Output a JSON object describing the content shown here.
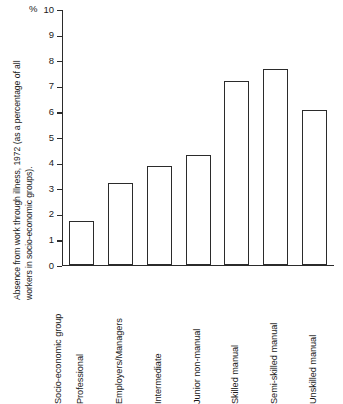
{
  "chart_data": {
    "type": "bar",
    "title": "",
    "subtitle": "",
    "ylabel_line1": "Absence from work through illness, 1972 (as a percentage of all",
    "ylabel_line2": "workers in socio-economic groups).",
    "xlabel": "Socio-economic group",
    "unit_symbol": "%",
    "categories": [
      "Professional",
      "Employers/Managers",
      "Intermediate",
      "Junior non-manual",
      "Skilled manual",
      "Semi-skilled manual",
      "Unskilled manual"
    ],
    "values": [
      1.7,
      3.2,
      3.85,
      4.3,
      7.2,
      7.65,
      6.05
    ],
    "ylim": [
      0,
      10
    ],
    "ytick_labels": [
      "10",
      "9",
      "8",
      "7",
      "6",
      "5",
      "4",
      "3",
      "2",
      "1",
      "0"
    ],
    "ytick_values": [
      10,
      9,
      8,
      7,
      6,
      5,
      4,
      3,
      2,
      1,
      0
    ],
    "grid": false,
    "legend": null,
    "bar_fill_color": "#ffffff",
    "bar_edge_color": "#2b2b2b",
    "axis_color": "#2b2b2b",
    "background_color": "#ffffff"
  }
}
